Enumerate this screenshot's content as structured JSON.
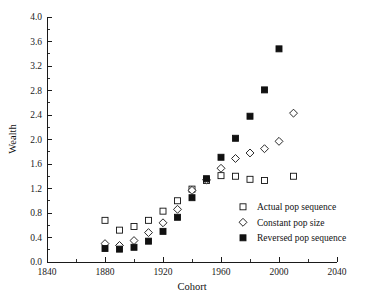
{
  "chart_data": {
    "type": "scatter",
    "title": "",
    "xlabel": "Cohort",
    "ylabel": "Wealth",
    "xlim": [
      1840,
      2040
    ],
    "ylim": [
      0.0,
      4.0
    ],
    "grid": false,
    "legend_position": "inside-lower-right",
    "x_ticks": [
      1840,
      1880,
      1920,
      1960,
      2000,
      2040
    ],
    "x_tick_labels": [
      "1840",
      "1880",
      "1920",
      "1960",
      "2000",
      "2040"
    ],
    "x_minor_ticks": [
      1860,
      1900,
      1940,
      1980,
      2020
    ],
    "y_ticks": [
      0.0,
      0.4,
      0.8,
      1.2,
      1.6,
      2.0,
      2.4,
      2.8,
      3.2,
      3.6,
      4.0
    ],
    "y_tick_labels": [
      "0.0",
      "0.4",
      "0.8",
      "1.2",
      "1.6",
      "2.0",
      "2.4",
      "2.8",
      "3.2",
      "3.6",
      "4.0"
    ],
    "y_minor_ticks": [
      0.2,
      0.6,
      1.0,
      1.4,
      1.8,
      2.2,
      2.6,
      3.0,
      3.4,
      3.8
    ],
    "series": [
      {
        "name": "Actual pop sequence",
        "marker": "open-square",
        "color": "#111111",
        "x": [
          1880,
          1890,
          1900,
          1910,
          1920,
          1930,
          1940,
          1950,
          1960,
          1970,
          1980,
          1990,
          2010
        ],
        "values": [
          0.68,
          0.52,
          0.58,
          0.68,
          0.83,
          1.0,
          1.19,
          1.33,
          1.41,
          1.4,
          1.35,
          1.33,
          1.4
        ]
      },
      {
        "name": "Constant pop size",
        "marker": "open-diamond",
        "color": "#111111",
        "x": [
          1880,
          1890,
          1900,
          1910,
          1920,
          1930,
          1940,
          1950,
          1960,
          1970,
          1980,
          1990,
          2000,
          2010
        ],
        "values": [
          0.3,
          0.27,
          0.35,
          0.48,
          0.64,
          0.86,
          1.17,
          1.34,
          1.53,
          1.69,
          1.78,
          1.85,
          1.97,
          2.43
        ]
      },
      {
        "name": "Reversed pop sequence",
        "marker": "filled-square",
        "color": "#111111",
        "x": [
          1880,
          1890,
          1900,
          1910,
          1920,
          1930,
          1940,
          1950,
          1960,
          1970,
          1980,
          1990,
          2000
        ],
        "values": [
          0.22,
          0.21,
          0.24,
          0.34,
          0.5,
          0.73,
          1.05,
          1.36,
          1.71,
          2.02,
          2.38,
          2.81,
          3.48
        ]
      }
    ]
  },
  "legend": {
    "items": [
      {
        "label": "Actual pop sequence",
        "marker": "open-square"
      },
      {
        "label": "Constant pop size",
        "marker": "open-diamond"
      },
      {
        "label": "Reversed pop sequence",
        "marker": "filled-square"
      }
    ]
  },
  "axes": {
    "x_title": "Cohort",
    "y_title": "Wealth"
  }
}
